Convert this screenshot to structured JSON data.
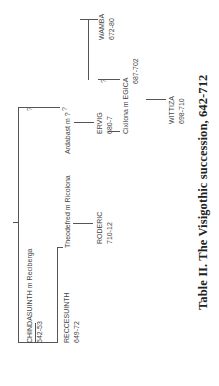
{
  "caption": "Table II. The Visigothic succession, 642-712",
  "unknown_marker": "?",
  "people": {
    "chindasuinth": {
      "name": "CHINDASUINTH m Reciberga",
      "dates": "642-53"
    },
    "reccesuinth": {
      "name": "RECCESUINTH",
      "dates": "649-72"
    },
    "theodefred": {
      "name": "Theodefred m Ricolona"
    },
    "roderic": {
      "name": "RODERIC",
      "dates": "710-12"
    },
    "ardabast": {
      "name": "Ardabast m ?"
    },
    "ervig": {
      "name": "ERVIG",
      "dates": "680-7"
    },
    "cixilona": {
      "name": "Cixilona m EGICA",
      "dates": "687-702"
    },
    "wittiza": {
      "name": "WITTIZA",
      "dates": "698-710"
    },
    "wamba": {
      "name": "WAMBA",
      "dates": "672-80"
    }
  }
}
